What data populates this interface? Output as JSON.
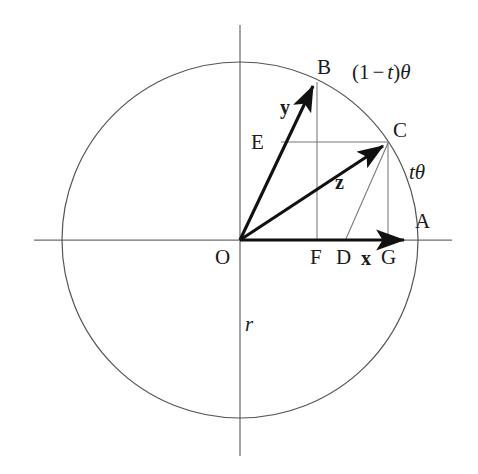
{
  "figure": {
    "kind": "geometric-diagram",
    "canvas": {
      "width": 478,
      "height": 474
    },
    "colors": {
      "background": "#ffffff",
      "axis": "#6b6b6b",
      "circle": "#555555",
      "vector": "#111111",
      "construction": "#777777",
      "text": "#1a1a1a"
    },
    "geometry": {
      "origin": {
        "x": 240,
        "y": 240
      },
      "radius": 178,
      "points": {
        "O": {
          "x": 240,
          "y": 240
        },
        "A": {
          "x": 418,
          "y": 240
        },
        "B": {
          "x": 316,
          "y": 80
        },
        "C": {
          "x": 388,
          "y": 142
        },
        "D": {
          "x": 345,
          "y": 240
        },
        "E": {
          "x": 281,
          "y": 142
        },
        "F": {
          "x": 317,
          "y": 240
        },
        "G": {
          "x": 388,
          "y": 240
        }
      }
    }
  },
  "labels": {
    "point_O": "O",
    "point_A": "A",
    "point_B": "B",
    "point_C": "C",
    "point_D": "D",
    "point_E": "E",
    "point_F": "F",
    "point_G": "G",
    "vector_x": "x",
    "vector_y": "y",
    "vector_z": "z",
    "radius_r": "r",
    "angle_t_theta": {
      "scalar": "t",
      "symbol": "θ"
    },
    "angle_one_minus_t_theta": {
      "open": "(1",
      "minus": "−",
      "scalar": "t",
      "close": ")",
      "symbol": "θ"
    }
  }
}
